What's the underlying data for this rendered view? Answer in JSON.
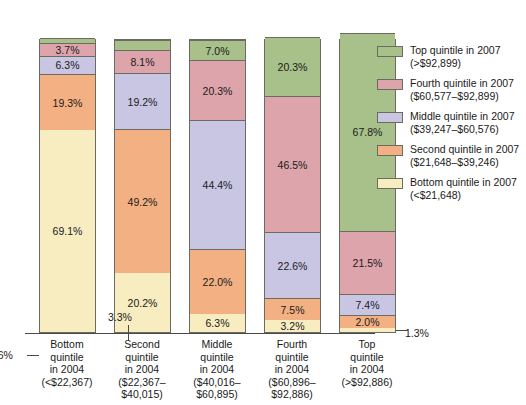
{
  "chart_data": {
    "type": "bar",
    "title": "",
    "subtitle": "",
    "xlabel": "",
    "ylabel": "",
    "ylim": [
      0,
      100
    ],
    "grid": false,
    "stacked": true,
    "stack_total": 100,
    "units": "percent",
    "legend_position": "right",
    "categories": [
      "Bottom quintile in 2004 (<$22,367)",
      "Second quintile in 2004 ($22,367–$40,015)",
      "Middle quintile in 2004 ($40,016–$60,895)",
      "Fourth quintile in 2004 ($60,896–$92,886)",
      "Top quintile in 2004 (>$92,886)"
    ],
    "series": [
      {
        "name": "Bottom quintile in 2007 (<$21,648)",
        "color": "#f7edc0",
        "values": [
          69.1,
          20.2,
          6.3,
          3.2,
          1.3
        ]
      },
      {
        "name": "Second quintile in 2007 ($21,648–$39,246)",
        "color": "#f3b183",
        "values": [
          19.3,
          49.2,
          22.0,
          7.5,
          2.0
        ]
      },
      {
        "name": "Middle quintile in 2007 ($39,247–$60,576)",
        "color": "#c9c6e4",
        "values": [
          6.3,
          19.2,
          44.4,
          22.6,
          7.4
        ]
      },
      {
        "name": "Fourth quintile in 2007 ($60,577–$92,899)",
        "color": "#dda5ab",
        "values": [
          3.7,
          8.1,
          20.3,
          46.5,
          21.5
        ]
      },
      {
        "name": "Top quintile in 2007 (>$92,899)",
        "color": "#a8c08a",
        "values": [
          1.6,
          3.3,
          7.0,
          20.3,
          67.8
        ]
      }
    ],
    "annotations": [
      {
        "text": "1.6%",
        "column": 0,
        "segment": 4,
        "placement": "left-leader"
      },
      {
        "text": "3.3%",
        "column": 1,
        "segment": 4,
        "placement": "top-leader"
      },
      {
        "text": "1.3%",
        "column": 4,
        "segment": 0,
        "placement": "right-leader"
      }
    ]
  },
  "columns": [
    {
      "label_lines": [
        "Bottom",
        "quintile",
        "in 2004",
        "(<$22,367)"
      ],
      "segments": [
        {
          "label": "69.1%",
          "value": 69.1,
          "tiny": false
        },
        {
          "label": "19.3%",
          "value": 19.3,
          "tiny": false
        },
        {
          "label": "6.3%",
          "value": 6.3,
          "tiny": false
        },
        {
          "label": "3.7%",
          "value": 3.7,
          "tiny": false
        },
        {
          "label": "1.6%",
          "value": 1.6,
          "tiny": true
        }
      ]
    },
    {
      "label_lines": [
        "Second",
        "quintile",
        "in 2004",
        "($22,367–",
        "$40,015)"
      ],
      "segments": [
        {
          "label": "20.2%",
          "value": 20.2,
          "tiny": false
        },
        {
          "label": "49.2%",
          "value": 49.2,
          "tiny": false
        },
        {
          "label": "19.2%",
          "value": 19.2,
          "tiny": false
        },
        {
          "label": "8.1%",
          "value": 8.1,
          "tiny": false
        },
        {
          "label": "3.3%",
          "value": 3.3,
          "tiny": true
        }
      ]
    },
    {
      "label_lines": [
        "Middle",
        "quintile",
        "in 2004",
        "($40,016–",
        "$60,895)"
      ],
      "segments": [
        {
          "label": "6.3%",
          "value": 6.3,
          "tiny": false
        },
        {
          "label": "22.0%",
          "value": 22.0,
          "tiny": false
        },
        {
          "label": "44.4%",
          "value": 44.4,
          "tiny": false
        },
        {
          "label": "20.3%",
          "value": 20.3,
          "tiny": false
        },
        {
          "label": "7.0%",
          "value": 7.0,
          "tiny": false
        }
      ]
    },
    {
      "label_lines": [
        "Fourth",
        "quintile",
        "in 2004",
        "($60,896–",
        "$92,886)"
      ],
      "segments": [
        {
          "label": "3.2%",
          "value": 3.2,
          "tiny": false
        },
        {
          "label": "7.5%",
          "value": 7.5,
          "tiny": false
        },
        {
          "label": "22.6%",
          "value": 22.6,
          "tiny": false
        },
        {
          "label": "46.5%",
          "value": 46.5,
          "tiny": false
        },
        {
          "label": "20.3%",
          "value": 20.3,
          "tiny": false
        }
      ]
    },
    {
      "label_lines": [
        "Top",
        "quintile",
        "in 2004",
        "(>$92,886)"
      ],
      "segments": [
        {
          "label": "1.3%",
          "value": 1.3,
          "tiny": true
        },
        {
          "label": "2.0%",
          "value": 2.0,
          "tiny": false
        },
        {
          "label": "7.4%",
          "value": 7.4,
          "tiny": false
        },
        {
          "label": "21.5%",
          "value": 21.5,
          "tiny": false
        },
        {
          "label": "67.8%",
          "value": 67.8,
          "tiny": false
        }
      ]
    }
  ],
  "callouts": {
    "bottom_top_cap": "1.6%",
    "second_top_cap": "3.3%",
    "top_bottom_cap": "1.3%"
  },
  "legend": {
    "items": [
      {
        "line1": "Top quintile in 2007",
        "line2": "(>$92,899)",
        "swatch": "sw4"
      },
      {
        "line1": "Fourth quintile in 2007",
        "line2": "($60,577–$92,899)",
        "swatch": "sw3"
      },
      {
        "line1": "Middle quintile in 2007",
        "line2": "($39,247–$60,576)",
        "swatch": "sw2"
      },
      {
        "line1": "Second quintile in 2007",
        "line2": "($21,648–$39,246)",
        "swatch": "sw1"
      },
      {
        "line1": "Bottom quintile in 2007",
        "line2": "(<$21,648)",
        "swatch": "sw0"
      }
    ]
  }
}
